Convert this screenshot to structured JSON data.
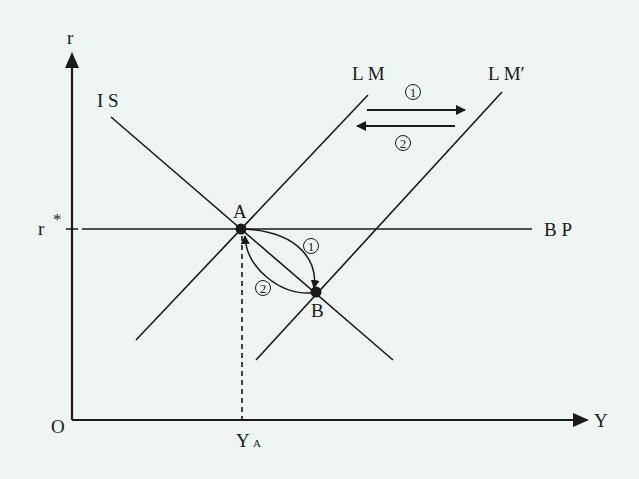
{
  "diagram": {
    "type": "IS-LM-BP diagram (Mundell-Fleming, fixed exchange rate / monetary policy)",
    "background": "#eef5f3",
    "line_color": "#1a1a1a",
    "axes": {
      "y_label": "r",
      "x_label": "Y",
      "origin_label": "O"
    },
    "levels": {
      "r_star_label": "r",
      "r_star_sup": "*",
      "ya_label": "Y",
      "ya_sub": "A"
    },
    "curves": {
      "is_label": "I S",
      "lm_label": "L M",
      "lm_prime_label": "L M′",
      "bp_label": "B P"
    },
    "points": {
      "a_label": "A",
      "b_label": "B"
    },
    "arrows": {
      "shift_right_label": "①",
      "shift_left_label": "②",
      "move_a_to_b_label": "①",
      "move_b_to_a_label": "②"
    }
  }
}
